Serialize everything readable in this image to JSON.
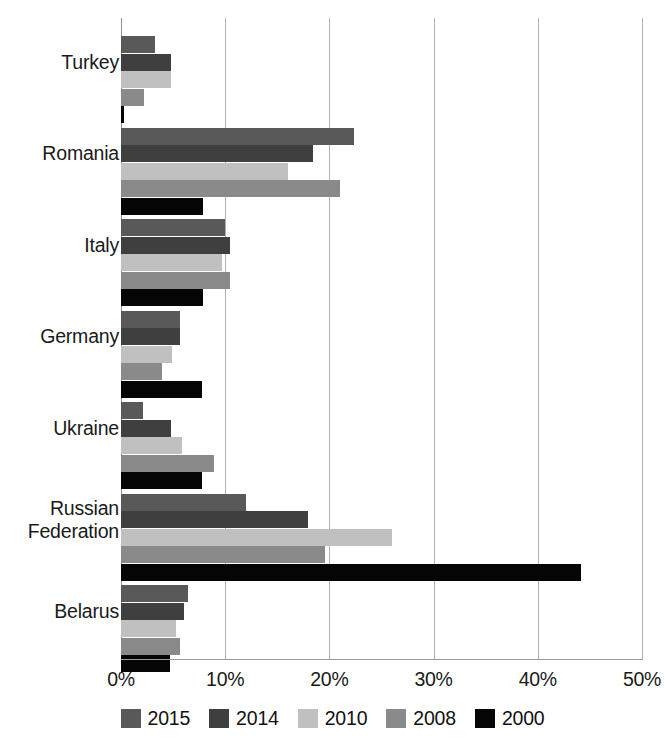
{
  "chart_data": {
    "type": "bar",
    "orientation": "horizontal",
    "title": "",
    "xlabel": "",
    "ylabel": "",
    "xlim": [
      0,
      50
    ],
    "xticks": [
      "0%",
      "10%",
      "20%",
      "30%",
      "40%",
      "50%"
    ],
    "xtick_values": [
      0,
      10,
      20,
      30,
      40,
      50
    ],
    "grid": "vertical",
    "legend_position": "bottom",
    "categories": [
      "Turkey",
      "Romania",
      "Italy",
      "Germany",
      "Ukraine",
      "Russian\nFederation",
      "Belarus"
    ],
    "series": [
      {
        "name": "2015",
        "color": "#595959",
        "values": [
          3.3,
          22.4,
          10.0,
          5.7,
          2.1,
          12.0,
          6.4
        ]
      },
      {
        "name": "2014",
        "color": "#3f3f3f",
        "values": [
          4.8,
          18.4,
          10.5,
          5.7,
          4.8,
          17.9,
          6.0
        ]
      },
      {
        "name": "2010",
        "color": "#c0c0c0",
        "values": [
          4.8,
          16.0,
          9.7,
          4.9,
          5.9,
          26.0,
          5.3
        ]
      },
      {
        "name": "2008",
        "color": "#8a8a8a",
        "values": [
          2.2,
          21.0,
          10.5,
          3.9,
          8.9,
          19.6,
          5.7
        ]
      },
      {
        "name": "2000",
        "color": "#050505",
        "values": [
          0.3,
          7.9,
          7.9,
          7.8,
          7.8,
          44.1,
          4.7
        ]
      }
    ]
  },
  "legend": {
    "items": [
      {
        "label": "2015",
        "color": "#595959"
      },
      {
        "label": "2014",
        "color": "#3f3f3f"
      },
      {
        "label": "2010",
        "color": "#c0c0c0"
      },
      {
        "label": "2008",
        "color": "#8a8a8a"
      },
      {
        "label": "2000",
        "color": "#050505"
      }
    ]
  },
  "axis": {
    "gridline_color": "#b0b0b0"
  }
}
